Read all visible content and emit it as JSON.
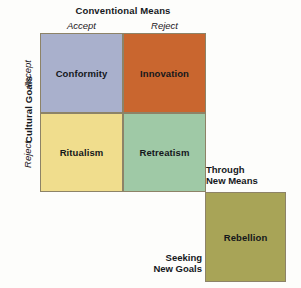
{
  "diagram": {
    "type": "2x2-typology-matrix",
    "columns": {
      "axis_title": "Conventional Means",
      "labels": [
        "Accept",
        "Reject"
      ]
    },
    "rows": {
      "axis_title": "Cultural Goals",
      "labels": [
        "Accept",
        "Reject"
      ]
    },
    "cells": [
      {
        "id": "conformity",
        "label": "Conformity",
        "row": "Accept",
        "column": "Accept",
        "color": "#a9b0cc"
      },
      {
        "id": "innovation",
        "label": "Innovation",
        "row": "Accept",
        "column": "Reject",
        "color": "#c9662f"
      },
      {
        "id": "ritualism",
        "label": "Ritualism",
        "row": "Reject",
        "column": "Accept",
        "color": "#f0dd8d"
      },
      {
        "id": "retreatism",
        "label": "Retreatism",
        "row": "Reject",
        "column": "Reject",
        "color": "#9fc9a6"
      },
      {
        "id": "rebellion",
        "label": "Rebellion",
        "row": "Seeking New Goals",
        "column": "Through New Means",
        "color": "#a8a457"
      }
    ],
    "annotations": {
      "through_new_means": "Through\nNew Means",
      "through_new_means_line1": "Through",
      "through_new_means_line2": "New Means",
      "seeking_new_goals_line1": "Seeking",
      "seeking_new_goals_line2": "New Goals"
    },
    "colors": {
      "background": "#fdfdfb",
      "border": "#8d8367",
      "text": "#15181c"
    }
  }
}
